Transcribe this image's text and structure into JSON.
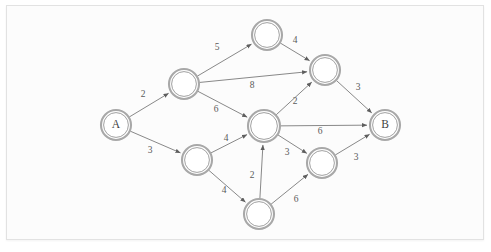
{
  "figure": {
    "background_color": "#fcfcfc",
    "frame_color": "#e2e2e2",
    "node_stroke_color": "#a8a8a8",
    "edge_stroke_color": "#7b7b7b",
    "label_color": "#3f3f3f"
  },
  "chart_data": {
    "type": "diagram",
    "subtype": "directed-weighted-graph",
    "title": "",
    "xlabel": "",
    "ylabel": "",
    "grid": false,
    "legend": "none",
    "nodes": [
      {
        "id": "A",
        "label": "A",
        "x": 116,
        "y": 125,
        "r": 15
      },
      {
        "id": "n1",
        "label": "",
        "x": 184,
        "y": 84,
        "r": 15
      },
      {
        "id": "n2",
        "label": "",
        "x": 267,
        "y": 35,
        "r": 15
      },
      {
        "id": "n3",
        "label": "",
        "x": 325,
        "y": 70,
        "r": 15
      },
      {
        "id": "n4",
        "label": "",
        "x": 264,
        "y": 126,
        "r": 16
      },
      {
        "id": "n5",
        "label": "",
        "x": 197,
        "y": 160,
        "r": 15
      },
      {
        "id": "n6",
        "label": "",
        "x": 259,
        "y": 214,
        "r": 15
      },
      {
        "id": "n7",
        "label": "",
        "x": 322,
        "y": 163,
        "r": 15
      },
      {
        "id": "B",
        "label": "B",
        "x": 385,
        "y": 125,
        "r": 15
      }
    ],
    "edges": [
      {
        "from": "A",
        "to": "n1",
        "weight": 2,
        "label_x": 143,
        "label_y": 95
      },
      {
        "from": "A",
        "to": "n5",
        "weight": 3,
        "label_x": 150,
        "label_y": 151
      },
      {
        "from": "n1",
        "to": "n2",
        "weight": 5,
        "label_x": 217,
        "label_y": 48
      },
      {
        "from": "n1",
        "to": "n3",
        "weight": 8,
        "label_x": 252,
        "label_y": 86
      },
      {
        "from": "n1",
        "to": "n4",
        "weight": 6,
        "label_x": 216,
        "label_y": 110
      },
      {
        "from": "n2",
        "to": "n3",
        "weight": 4,
        "label_x": 295,
        "label_y": 41
      },
      {
        "from": "n3",
        "to": "B",
        "weight": 3,
        "label_x": 358,
        "label_y": 88
      },
      {
        "from": "n4",
        "to": "n3",
        "weight": 2,
        "label_x": 295,
        "label_y": 102
      },
      {
        "from": "n4",
        "to": "B",
        "weight": 6,
        "label_x": 320,
        "label_y": 132
      },
      {
        "from": "n4",
        "to": "n7",
        "weight": 3,
        "label_x": 287,
        "label_y": 153
      },
      {
        "from": "n5",
        "to": "n4",
        "weight": 4,
        "label_x": 226,
        "label_y": 139
      },
      {
        "from": "n5",
        "to": "n6",
        "weight": 4,
        "label_x": 224,
        "label_y": 191
      },
      {
        "from": "n6",
        "to": "n4",
        "weight": 2,
        "label_x": 252,
        "label_y": 176
      },
      {
        "from": "n6",
        "to": "n7",
        "weight": 6,
        "label_x": 296,
        "label_y": 200
      },
      {
        "from": "n7",
        "to": "B",
        "weight": 3,
        "label_x": 356,
        "label_y": 158
      }
    ],
    "source_node": "A",
    "sink_node": "B",
    "node_count": 9,
    "edge_count": 15
  }
}
